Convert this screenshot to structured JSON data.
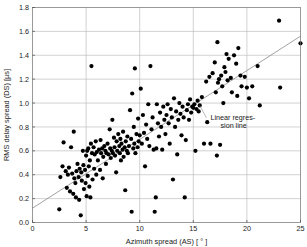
{
  "chart_data": {
    "type": "scatter",
    "title": "",
    "xlabel": "Azimuth spread (AS) [ ° ]",
    "ylabel": "RMS delay spread (DS) [µs]",
    "xlim": [
      0,
      25
    ],
    "ylim": [
      0.0,
      1.8
    ],
    "xticks": [
      0,
      5,
      10,
      15,
      20,
      25
    ],
    "xtick_labels": [
      "0",
      "5",
      "10",
      "15",
      "20",
      "25"
    ],
    "yticks": [
      0.0,
      0.2,
      0.4,
      0.6,
      0.8,
      1.0,
      1.2,
      1.4,
      1.6,
      1.8
    ],
    "ytick_labels": [
      "0.0",
      "0.2",
      "0.4",
      "0.6",
      "0.8",
      "1.0",
      "1.2",
      "1.4",
      "1.6",
      "1.8"
    ],
    "grid": true,
    "legend": "none",
    "marker_color": "#000000",
    "line_color": "#8a8a8a",
    "grid_color": "#b4b4b4",
    "annotations": [
      {
        "name": "regression-annotation",
        "text_line1": "Linear regres-",
        "text_line2": "sion line",
        "x": 16.6,
        "y": 0.86,
        "leader_from_x": 15.6,
        "leader_from_y": 0.98
      }
    ],
    "series": [
      {
        "name": "measurements",
        "marker": "circle",
        "points": [
          [
            2.5,
            0.11
          ],
          [
            2.6,
            0.38
          ],
          [
            2.8,
            0.47
          ],
          [
            2.9,
            0.67
          ],
          [
            3.1,
            0.43
          ],
          [
            3.2,
            0.29
          ],
          [
            3.3,
            0.4
          ],
          [
            3.4,
            0.46
          ],
          [
            3.5,
            0.26
          ],
          [
            3.6,
            0.63
          ],
          [
            3.7,
            0.41
          ],
          [
            3.8,
            0.24
          ],
          [
            3.85,
            0.76
          ],
          [
            3.9,
            0.37
          ],
          [
            4.0,
            0.33
          ],
          [
            4.05,
            0.21
          ],
          [
            4.1,
            0.43
          ],
          [
            4.2,
            0.49
          ],
          [
            4.3,
            0.38
          ],
          [
            4.35,
            0.19
          ],
          [
            4.4,
            0.45
          ],
          [
            4.5,
            0.06
          ],
          [
            4.55,
            0.42
          ],
          [
            4.6,
            0.35
          ],
          [
            4.7,
            0.6
          ],
          [
            4.75,
            0.48
          ],
          [
            4.8,
            0.28
          ],
          [
            4.9,
            0.44
          ],
          [
            4.95,
            0.33
          ],
          [
            5.0,
            0.56
          ],
          [
            5.05,
            0.22
          ],
          [
            5.1,
            0.6
          ],
          [
            5.15,
            0.39
          ],
          [
            5.2,
            0.62
          ],
          [
            5.25,
            0.47
          ],
          [
            5.3,
            0.3
          ],
          [
            5.35,
            0.52
          ],
          [
            5.4,
            0.21
          ],
          [
            5.45,
            0.66
          ],
          [
            5.5,
            1.31
          ],
          [
            5.55,
            0.58
          ],
          [
            5.6,
            0.36
          ],
          [
            5.7,
            0.63
          ],
          [
            5.75,
            0.45
          ],
          [
            5.8,
            0.57
          ],
          [
            5.9,
            0.68
          ],
          [
            5.95,
            0.4
          ],
          [
            6.0,
            0.59
          ],
          [
            6.1,
            0.52
          ],
          [
            6.2,
            0.61
          ],
          [
            6.3,
            0.44
          ],
          [
            6.35,
            0.69
          ],
          [
            6.4,
            0.58
          ],
          [
            6.5,
            0.62
          ],
          [
            6.55,
            0.37
          ],
          [
            6.6,
            0.55
          ],
          [
            6.7,
            0.64
          ],
          [
            6.8,
            0.6
          ],
          [
            6.85,
            0.49
          ],
          [
            6.9,
            0.58
          ],
          [
            7.0,
            0.66
          ],
          [
            7.1,
            0.57
          ],
          [
            7.2,
            0.78
          ],
          [
            7.25,
            0.62
          ],
          [
            7.3,
            0.54
          ],
          [
            7.4,
            0.6
          ],
          [
            7.45,
            0.86
          ],
          [
            7.5,
            0.58
          ],
          [
            7.6,
            0.71
          ],
          [
            7.65,
            0.63
          ],
          [
            7.7,
            0.56
          ],
          [
            7.8,
            0.42
          ],
          [
            7.85,
            0.68
          ],
          [
            7.9,
            0.6
          ],
          [
            8.0,
            0.74
          ],
          [
            8.1,
            0.64
          ],
          [
            8.15,
            0.58
          ],
          [
            8.2,
            0.7
          ],
          [
            8.25,
            0.52
          ],
          [
            8.3,
            0.66
          ],
          [
            8.4,
            0.61
          ],
          [
            8.45,
            0.76
          ],
          [
            8.5,
            0.55
          ],
          [
            8.6,
            0.63
          ],
          [
            8.65,
            0.27
          ],
          [
            8.7,
            0.68
          ],
          [
            8.8,
            0.6
          ],
          [
            8.85,
            0.72
          ],
          [
            8.9,
            0.58
          ],
          [
            9.0,
            0.64
          ],
          [
            9.1,
            0.94
          ],
          [
            9.2,
            0.7
          ],
          [
            9.25,
            0.09
          ],
          [
            9.3,
            1.08
          ],
          [
            9.4,
            0.62
          ],
          [
            9.45,
            0.8
          ],
          [
            9.5,
            0.66
          ],
          [
            9.55,
            1.29
          ],
          [
            9.6,
            0.58
          ],
          [
            9.7,
            0.74
          ],
          [
            9.8,
            0.63
          ],
          [
            9.85,
            0.87
          ],
          [
            9.9,
            0.68
          ],
          [
            10.0,
            0.73
          ],
          [
            10.1,
            1.12
          ],
          [
            10.2,
            0.66
          ],
          [
            10.3,
            0.9
          ],
          [
            10.4,
            0.75
          ],
          [
            10.5,
            0.47
          ],
          [
            10.6,
            0.82
          ],
          [
            10.7,
            0.7
          ],
          [
            10.8,
            0.99
          ],
          [
            10.9,
            0.64
          ],
          [
            11.0,
            1.31
          ],
          [
            11.1,
            0.78
          ],
          [
            11.2,
            0.88
          ],
          [
            11.3,
            0.61
          ],
          [
            11.4,
            0.09
          ],
          [
            11.5,
            0.21
          ],
          [
            11.55,
            0.62
          ],
          [
            11.6,
            0.99
          ],
          [
            11.7,
            0.83
          ],
          [
            11.8,
            0.72
          ],
          [
            11.9,
            0.92
          ],
          [
            12.0,
            0.8
          ],
          [
            12.1,
            0.61
          ],
          [
            12.2,
            0.97
          ],
          [
            12.3,
            0.86
          ],
          [
            12.4,
            0.74
          ],
          [
            12.5,
            0.9
          ],
          [
            12.6,
            0.99
          ],
          [
            12.7,
            0.83
          ],
          [
            12.8,
            0.66
          ],
          [
            12.9,
            0.95
          ],
          [
            13.0,
            0.88
          ],
          [
            13.1,
            0.36
          ],
          [
            13.2,
            1.04
          ],
          [
            13.3,
            0.8
          ],
          [
            13.4,
            0.93
          ],
          [
            13.5,
            0.57
          ],
          [
            13.6,
            0.86
          ],
          [
            13.7,
            1.0
          ],
          [
            13.8,
            0.91
          ],
          [
            13.9,
            0.73
          ],
          [
            14.0,
            0.97
          ],
          [
            14.1,
            0.88
          ],
          [
            14.2,
            0.21
          ],
          [
            14.3,
            0.69
          ],
          [
            14.4,
            0.94
          ],
          [
            14.5,
            0.99
          ],
          [
            14.6,
            0.86
          ],
          [
            14.7,
            1.03
          ],
          [
            14.8,
            0.92
          ],
          [
            14.9,
            0.97
          ],
          [
            15.0,
            0.96
          ],
          [
            15.1,
            0.99
          ],
          [
            15.2,
            0.6
          ],
          [
            15.3,
            0.95
          ],
          [
            15.4,
            1.02
          ],
          [
            15.5,
            0.93
          ],
          [
            15.6,
            0.98
          ],
          [
            15.8,
            1.05
          ],
          [
            16.0,
            0.66
          ],
          [
            16.2,
            1.18
          ],
          [
            16.3,
            0.84
          ],
          [
            16.5,
            1.22
          ],
          [
            16.6,
            0.66
          ],
          [
            16.8,
            1.25
          ],
          [
            17.0,
            1.34
          ],
          [
            17.1,
            1.09
          ],
          [
            17.2,
            0.56
          ],
          [
            17.25,
            1.51
          ],
          [
            17.3,
            1.17
          ],
          [
            17.4,
            1.2
          ],
          [
            17.5,
            0.65
          ],
          [
            17.6,
            1.23
          ],
          [
            17.7,
            1.14
          ],
          [
            17.8,
            1.0
          ],
          [
            17.9,
            1.3
          ],
          [
            18.0,
            1.26
          ],
          [
            18.1,
            1.41
          ],
          [
            18.2,
            1.19
          ],
          [
            18.3,
            1.37
          ],
          [
            18.5,
            1.21
          ],
          [
            18.6,
            1.09
          ],
          [
            18.8,
            1.4
          ],
          [
            19.0,
            1.33
          ],
          [
            19.1,
            1.06
          ],
          [
            19.2,
            1.46
          ],
          [
            19.4,
            1.23
          ],
          [
            19.5,
            1.14
          ],
          [
            19.8,
            1.22
          ],
          [
            20.0,
            1.13
          ],
          [
            20.2,
            1.04
          ],
          [
            20.5,
            1.14
          ],
          [
            21.0,
            1.31
          ],
          [
            21.2,
            0.98
          ],
          [
            23.0,
            1.69
          ],
          [
            23.1,
            1.13
          ],
          [
            25.0,
            1.5
          ]
        ]
      }
    ],
    "regression": {
      "name": "linear-regression-line",
      "x_start": 0,
      "y_start": 0.12,
      "x_end": 25,
      "y_end": 1.56
    }
  }
}
